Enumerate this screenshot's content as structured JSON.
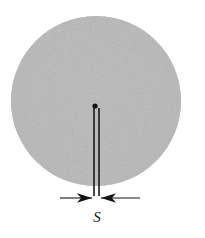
{
  "figure": {
    "name": "circular-aperture-with-slit-diagram",
    "background_color": "#ffffff",
    "width": 205,
    "height": 238
  },
  "disk": {
    "name": "shaded-circular-disk",
    "fill_color": "#b9b9b9",
    "edge_color": "#b0b0b0",
    "center_x": 96,
    "center_y": 101,
    "radius": 85,
    "texture": "speckled-grain"
  },
  "slit": {
    "name": "vertical-slit",
    "label": "S",
    "line_color": "#1a1a1a",
    "left_edge_x": 94,
    "right_edge_x": 99,
    "top_y": 108,
    "bottom_y": 196,
    "gap_width_px": 5
  },
  "source_point": {
    "name": "source-dot",
    "color": "#111111",
    "x": 95,
    "y": 106,
    "radius": 2.6
  },
  "dimension": {
    "name": "slit-width-dimension",
    "label": "S",
    "label_x": 97,
    "label_y": 222,
    "line_y": 198,
    "left_tail_x": 60,
    "right_tail_x": 140,
    "arrow_color": "#141414",
    "left_arrow_tip_x": 92,
    "right_arrow_tip_x": 101
  }
}
